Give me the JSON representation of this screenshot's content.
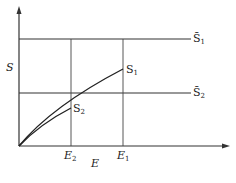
{
  "diagram": {
    "y_axis_label": "S",
    "x_axis_label": "E",
    "x_ticks": [
      {
        "base": "E",
        "sub": "2"
      },
      {
        "base": "E",
        "sub": "1"
      }
    ],
    "horizontal_lines": [
      {
        "base": "S̄",
        "sub": "1"
      },
      {
        "base": "S̄",
        "sub": "2"
      }
    ],
    "curves": [
      {
        "base": "S",
        "sub": "1"
      },
      {
        "base": "S",
        "sub": "2"
      }
    ],
    "colors": {
      "line": "#333333",
      "background": "#ffffff"
    }
  }
}
